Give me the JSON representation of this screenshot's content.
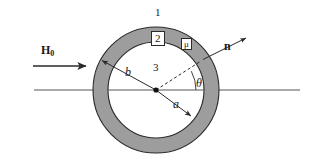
{
  "figure": {
    "type": "cross-section-diagram",
    "background_color": "#ffffff",
    "shell_fill_color": "#9d9d9d",
    "core_fill_color": "#ffffff",
    "stroke_color": "#2a2a2a",
    "geometry": {
      "center_x": 156,
      "center_y": 90,
      "outer_radius": 63,
      "inner_radius": 48,
      "axis_line_x_start": 34,
      "axis_line_x_end": 300,
      "theta_degrees": 28
    },
    "labels": {
      "region_outer": "1",
      "region_shell": "2",
      "region_core": "3",
      "permeability": "μ",
      "field": "H",
      "field_subscript": "0",
      "normal": "n",
      "radius_outer": "b",
      "radius_inner": "a",
      "angle": "θ"
    },
    "arrows": [
      {
        "name": "field-arrow",
        "label": "H0",
        "from_x": 33,
        "from_y": 66,
        "to_x": 88,
        "to_y": 66
      },
      {
        "name": "outer-radius-arrow",
        "label": "b",
        "from_x": 156,
        "from_y": 90,
        "to_x": 101,
        "to_y": 60
      },
      {
        "name": "inner-radius-arrow",
        "label": "a",
        "from_x": 156,
        "from_y": 90,
        "to_x": 192,
        "to_y": 117
      },
      {
        "name": "normal-arrow",
        "label": "n",
        "from_x": 196,
        "from_y": 65,
        "to_x": 248,
        "to_y": 37
      }
    ]
  }
}
